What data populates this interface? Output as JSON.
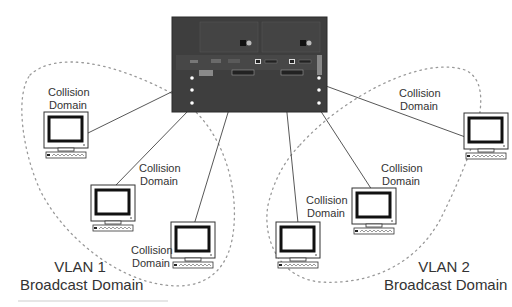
{
  "diagram": {
    "type": "network-vlan-diagram",
    "switch": {
      "name": "switch",
      "color": "#3e3e3e"
    },
    "vlans": [
      {
        "id": "vlan1",
        "title": "VLAN 1",
        "subtitle": "Broadcast Domain"
      },
      {
        "id": "vlan2",
        "title": "VLAN 2",
        "subtitle": "Broadcast Domain"
      }
    ],
    "collision_labels": [
      {
        "line1": "Collision",
        "line2": "Domain"
      },
      {
        "line1": "Collision",
        "line2": "Domain"
      },
      {
        "line1": "Collision",
        "line2": "Domain"
      },
      {
        "line1": "Collision",
        "line2": "Domain"
      },
      {
        "line1": "Collision",
        "line2": "Domain"
      },
      {
        "line1": "Collision",
        "line2": "Domain"
      }
    ],
    "computers": [
      {
        "id": "pc1",
        "vlan": "VLAN 1"
      },
      {
        "id": "pc2",
        "vlan": "VLAN 1"
      },
      {
        "id": "pc3",
        "vlan": "VLAN 1"
      },
      {
        "id": "pc4",
        "vlan": "VLAN 2"
      },
      {
        "id": "pc5",
        "vlan": "VLAN 2"
      },
      {
        "id": "pc6",
        "vlan": "VLAN 2"
      }
    ]
  }
}
